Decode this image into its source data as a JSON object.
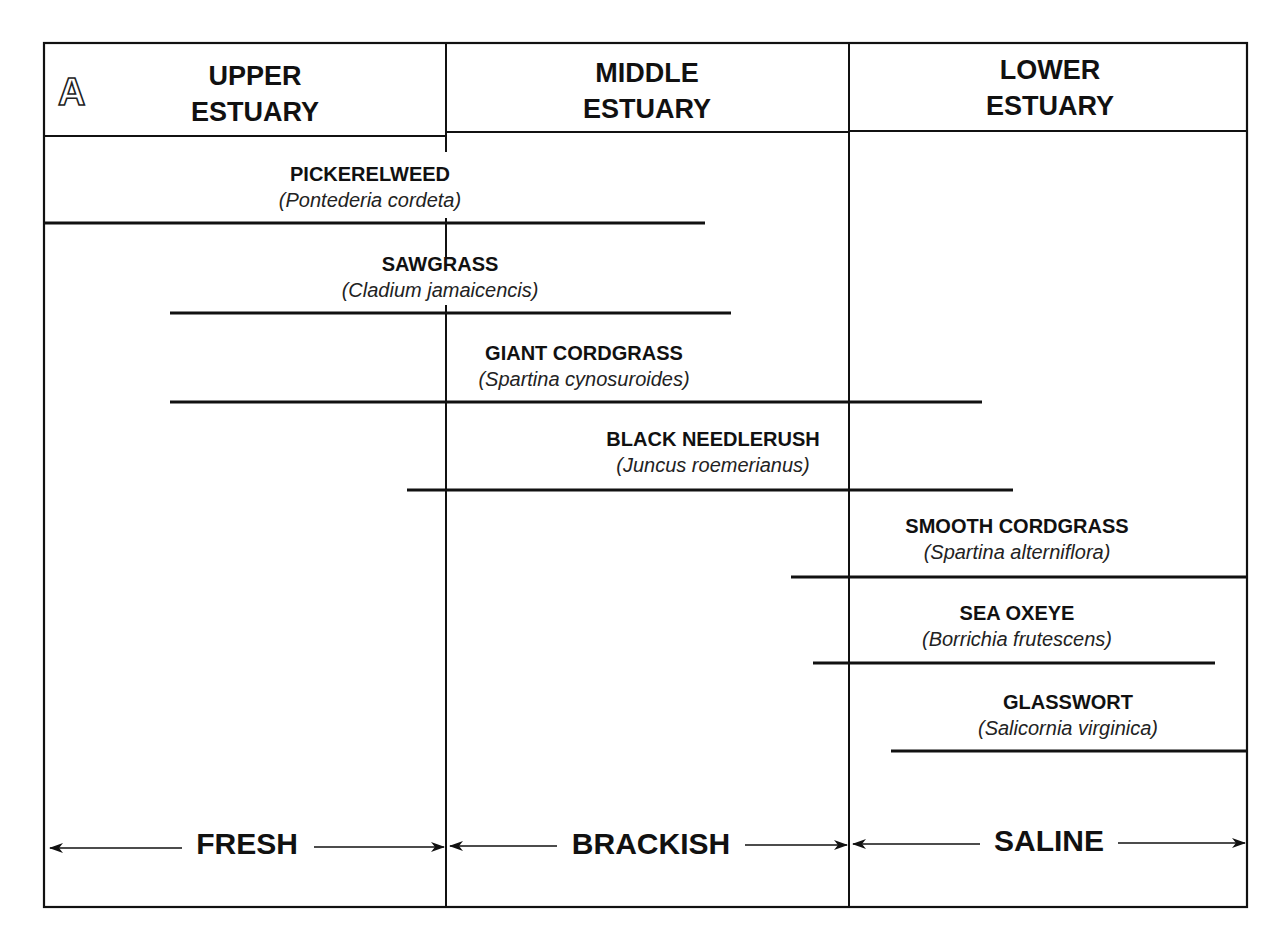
{
  "panel_label": "A",
  "headers": [
    {
      "line1": "UPPER",
      "line2": "ESTUARY"
    },
    {
      "line1": "MIDDLE",
      "line2": "ESTUARY"
    },
    {
      "line1": "LOWER",
      "line2": "ESTUARY"
    }
  ],
  "species": [
    {
      "common": "PICKERELWEED",
      "scientific": "(Pontederia cordeta)",
      "range_x": [
        43,
        705
      ],
      "line_y": 223
    },
    {
      "common": "SAWGRASS",
      "scientific": "(Cladium jamaicencis)",
      "range_x": [
        170,
        731
      ],
      "line_y": 313
    },
    {
      "common": "GIANT CORDGRASS",
      "scientific": "(Spartina cynosuroides)",
      "range_x": [
        170,
        982
      ],
      "line_y": 402
    },
    {
      "common": "BLACK NEEDLERUSH",
      "scientific": "(Juncus roemerianus)",
      "range_x": [
        407,
        1013
      ],
      "line_y": 490
    },
    {
      "common": "SMOOTH CORDGRASS",
      "scientific": "(Spartina alterniflora)",
      "range_x": [
        791,
        1247
      ],
      "line_y": 577
    },
    {
      "common": "SEA OXEYE",
      "scientific": "(Borrichia frutescens)",
      "range_x": [
        813,
        1215
      ],
      "line_y": 663
    },
    {
      "common": "GLASSWORT",
      "scientific": "(Salicornia virginica)",
      "range_x": [
        891,
        1247
      ],
      "line_y": 751
    }
  ],
  "zones": [
    {
      "label": "FRESH"
    },
    {
      "label": "BRACKISH"
    },
    {
      "label": "SALINE"
    }
  ]
}
